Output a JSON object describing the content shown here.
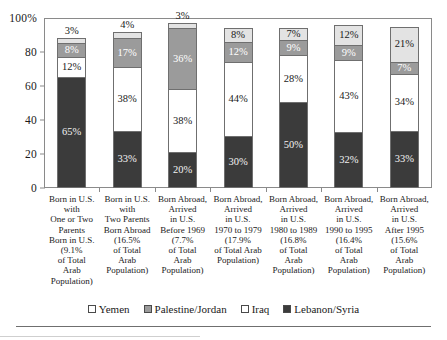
{
  "chart_data": {
    "type": "bar",
    "subtype": "stacked-bar-100",
    "title": "",
    "xlabel": "",
    "ylabel": "",
    "ylim": [
      0,
      100
    ],
    "yticks": [
      "0",
      "20",
      "40",
      "60",
      "80",
      "100%"
    ],
    "ytick_values": [
      0,
      20,
      40,
      60,
      80,
      100
    ],
    "grid": false,
    "legend_position": "bottom",
    "stack_order_bottom_to_top": [
      "Lebanon/Syria",
      "Iraq",
      "Palestine/Jordan",
      "Yemen"
    ],
    "categories": [
      "Born in U.S. with One or Two Parents Born in U.S. (9.1% of Total Arab Population)",
      "Born in U.S. with Two Parents Born Abroad (16.5% of Total Arab Population)",
      "Born Abroad, Arrived in U.S. Before 1969 (7.7% of Total Arab Population)",
      "Born Abroad, Arrived in U.S. 1970 to 1979 (17.9% of Total Arab Population)",
      "Born Abroad, Arrived in U.S. 1980 to 1989 (16.8% of Total Arab Population)",
      "Born Abroad, Arrived in U.S. 1990 to 1995 (16.4% of Total Arab Population)",
      "Born Abroad, Arrived in U.S. After 1995 (15.6% of Total Arab Population)"
    ],
    "series": [
      {
        "name": "Lebanon/Syria",
        "color": "#3b3b3b",
        "values": [
          65,
          33,
          20,
          30,
          50,
          32,
          33
        ]
      },
      {
        "name": "Iraq",
        "color": "#ffffff",
        "values": [
          12,
          38,
          38,
          44,
          28,
          43,
          34
        ]
      },
      {
        "name": "Palestine/Jordan",
        "color": "#9b9b9b",
        "values": [
          8,
          17,
          36,
          12,
          9,
          9,
          7
        ]
      },
      {
        "name": "Yemen",
        "color": "#e3e3e3",
        "values": [
          3,
          4,
          3,
          8,
          7,
          12,
          21
        ]
      }
    ],
    "bar_totals": [
      88,
      92,
      97,
      94,
      94,
      96,
      95
    ]
  },
  "yaxis": {
    "ticks": [
      {
        "label": "100%",
        "value": 100
      },
      {
        "label": "80",
        "value": 80
      },
      {
        "label": "60",
        "value": 60
      },
      {
        "label": "40",
        "value": 40
      },
      {
        "label": "20",
        "value": 20
      },
      {
        "label": "0",
        "value": 0
      }
    ]
  },
  "bars": [
    {
      "category_lines": [
        "Born in U.S.",
        "with",
        "One or Two",
        "Parents",
        "Born in U.S.",
        "(9.1%",
        "of Total",
        "Arab",
        "Population)"
      ],
      "top_label": "3%",
      "segments": [
        {
          "series": "Lebanon/Syria",
          "label": "65%",
          "value": 65
        },
        {
          "series": "Iraq",
          "label": "12%",
          "value": 12
        },
        {
          "series": "Palestine/Jordan",
          "label": "8%",
          "value": 8
        },
        {
          "series": "Yemen",
          "label": "",
          "value": 3
        }
      ]
    },
    {
      "category_lines": [
        "Born in U.S.",
        "with",
        "Two Parents",
        "Born Abroad",
        "(16.5%",
        "of Total",
        "Arab",
        "Population)"
      ],
      "top_label": "4%",
      "segments": [
        {
          "series": "Lebanon/Syria",
          "label": "33%",
          "value": 33
        },
        {
          "series": "Iraq",
          "label": "38%",
          "value": 38
        },
        {
          "series": "Palestine/Jordan",
          "label": "17%",
          "value": 17
        },
        {
          "series": "Yemen",
          "label": "",
          "value": 4
        }
      ]
    },
    {
      "category_lines": [
        "Born Abroad,",
        "Arrived",
        "in U.S.",
        "Before 1969",
        "(7.7%",
        "of Total",
        "Arab",
        "Population)"
      ],
      "top_label": "3%",
      "segments": [
        {
          "series": "Lebanon/Syria",
          "label": "20%",
          "value": 20
        },
        {
          "series": "Iraq",
          "label": "38%",
          "value": 38
        },
        {
          "series": "Palestine/Jordan",
          "label": "36%",
          "value": 36
        },
        {
          "series": "Yemen",
          "label": "",
          "value": 3
        }
      ]
    },
    {
      "category_lines": [
        "Born Abroad,",
        "Arrived",
        "in U.S.",
        "1970 to 1979",
        "(17.9%",
        "of Total Arab",
        "Population)"
      ],
      "top_label": "",
      "segments": [
        {
          "series": "Lebanon/Syria",
          "label": "30%",
          "value": 30
        },
        {
          "series": "Iraq",
          "label": "44%",
          "value": 44
        },
        {
          "series": "Palestine/Jordan",
          "label": "12%",
          "value": 12
        },
        {
          "series": "Yemen",
          "label": "8%",
          "value": 8
        }
      ]
    },
    {
      "category_lines": [
        "Born Abroad,",
        "Arrived",
        "in U.S.",
        "1980 to 1989",
        "(16.8%",
        "of Total",
        "Arab",
        "Population)"
      ],
      "top_label": "",
      "segments": [
        {
          "series": "Lebanon/Syria",
          "label": "50%",
          "value": 50
        },
        {
          "series": "Iraq",
          "label": "28%",
          "value": 28
        },
        {
          "series": "Palestine/Jordan",
          "label": "9%",
          "value": 9
        },
        {
          "series": "Yemen",
          "label": "7%",
          "value": 7
        }
      ]
    },
    {
      "category_lines": [
        "Born Abroad,",
        "Arrived",
        "in U.S.",
        "1990 to 1995",
        "(16.4%",
        "of Total",
        "Arab",
        "Population)"
      ],
      "top_label": "",
      "segments": [
        {
          "series": "Lebanon/Syria",
          "label": "32%",
          "value": 32
        },
        {
          "series": "Iraq",
          "label": "43%",
          "value": 43
        },
        {
          "series": "Palestine/Jordan",
          "label": "9%",
          "value": 9
        },
        {
          "series": "Yemen",
          "label": "12%",
          "value": 12
        }
      ]
    },
    {
      "category_lines": [
        "Born Abroad,",
        "Arrived",
        "in U.S.",
        "After 1995",
        "(15.6%",
        "of Total",
        "Arab",
        "Population)"
      ],
      "top_label": "",
      "segments": [
        {
          "series": "Lebanon/Syria",
          "label": "33%",
          "value": 33
        },
        {
          "series": "Iraq",
          "label": "34%",
          "value": 34
        },
        {
          "series": "Palestine/Jordan",
          "label": "7%",
          "value": 7
        },
        {
          "series": "Yemen",
          "label": "21%",
          "value": 21
        }
      ]
    }
  ],
  "legend": {
    "items": [
      {
        "label": "Yemen",
        "swatch": "yemen",
        "color": "#ffffff"
      },
      {
        "label": "Palestine/Jordan",
        "swatch": "palestine",
        "color": "#9b9b9b"
      },
      {
        "label": "Iraq",
        "swatch": "iraq",
        "color": "#ffffff"
      },
      {
        "label": "Lebanon/Syria",
        "swatch": "lebanon",
        "color": "#3b3b3b"
      }
    ]
  }
}
